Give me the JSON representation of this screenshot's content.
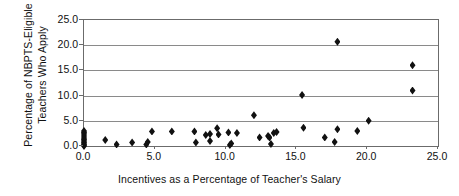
{
  "chart_data": {
    "type": "scatter",
    "title": "",
    "xlabel": "Incentives as a Percentage of Teacher's Salary",
    "ylabel": "Percentage of NBPTS-Eligible Teachers Who Apply",
    "ylabel_lines": [
      "Percentage of NBPTS-Eligible",
      "Teachers Who Apply"
    ],
    "xlim": [
      0.0,
      25.0
    ],
    "ylim": [
      0.0,
      25.0
    ],
    "xticks": [
      "0.0",
      "5.0",
      "10.0",
      "15.0",
      "20.0",
      "25.0"
    ],
    "xtick_values": [
      0.0,
      5.0,
      10.0,
      15.0,
      20.0,
      25.0
    ],
    "yticks": [
      "0.0",
      "5.0",
      "10.0",
      "15.0",
      "20.0",
      "25.0"
    ],
    "ytick_values": [
      0.0,
      5.0,
      10.0,
      15.0,
      20.0,
      25.0
    ],
    "grid": "horizontal",
    "gridline_values": [
      5.0,
      10.0,
      15.0,
      20.0
    ],
    "legend": "none",
    "marker": "diamond",
    "marker_color": "#111111",
    "points": [
      {
        "x": 0.0,
        "y": 0.0
      },
      {
        "x": 0.0,
        "y": 0.2
      },
      {
        "x": 0.0,
        "y": 0.4
      },
      {
        "x": 0.0,
        "y": 0.7
      },
      {
        "x": 0.0,
        "y": 1.0
      },
      {
        "x": 0.0,
        "y": 1.3
      },
      {
        "x": 0.0,
        "y": 1.6
      },
      {
        "x": 0.0,
        "y": 2.0
      },
      {
        "x": 0.0,
        "y": 2.4
      },
      {
        "x": 0.0,
        "y": 2.7
      },
      {
        "x": 0.0,
        "y": 3.0
      },
      {
        "x": 1.5,
        "y": 1.2
      },
      {
        "x": 2.3,
        "y": 0.3
      },
      {
        "x": 3.4,
        "y": 0.7
      },
      {
        "x": 4.4,
        "y": 0.3
      },
      {
        "x": 4.5,
        "y": 0.8
      },
      {
        "x": 4.8,
        "y": 2.9
      },
      {
        "x": 6.2,
        "y": 2.9
      },
      {
        "x": 7.8,
        "y": 2.9
      },
      {
        "x": 7.9,
        "y": 0.7
      },
      {
        "x": 8.6,
        "y": 2.2
      },
      {
        "x": 8.9,
        "y": 2.4
      },
      {
        "x": 8.9,
        "y": 1.0
      },
      {
        "x": 9.4,
        "y": 3.5
      },
      {
        "x": 9.5,
        "y": 2.3
      },
      {
        "x": 10.2,
        "y": 2.7
      },
      {
        "x": 10.3,
        "y": 0.2
      },
      {
        "x": 10.4,
        "y": 0.5
      },
      {
        "x": 10.8,
        "y": 2.6
      },
      {
        "x": 12.0,
        "y": 6.1
      },
      {
        "x": 12.4,
        "y": 1.7
      },
      {
        "x": 13.0,
        "y": 2.0
      },
      {
        "x": 13.1,
        "y": 1.7
      },
      {
        "x": 13.2,
        "y": 0.4
      },
      {
        "x": 13.4,
        "y": 2.6
      },
      {
        "x": 13.6,
        "y": 2.8
      },
      {
        "x": 15.4,
        "y": 10.1
      },
      {
        "x": 15.5,
        "y": 3.6
      },
      {
        "x": 17.0,
        "y": 1.7
      },
      {
        "x": 17.7,
        "y": 0.8
      },
      {
        "x": 17.9,
        "y": 20.7
      },
      {
        "x": 17.9,
        "y": 3.3
      },
      {
        "x": 19.3,
        "y": 3.0
      },
      {
        "x": 20.1,
        "y": 5.0
      },
      {
        "x": 23.2,
        "y": 16.0
      },
      {
        "x": 23.2,
        "y": 11.0
      }
    ]
  }
}
